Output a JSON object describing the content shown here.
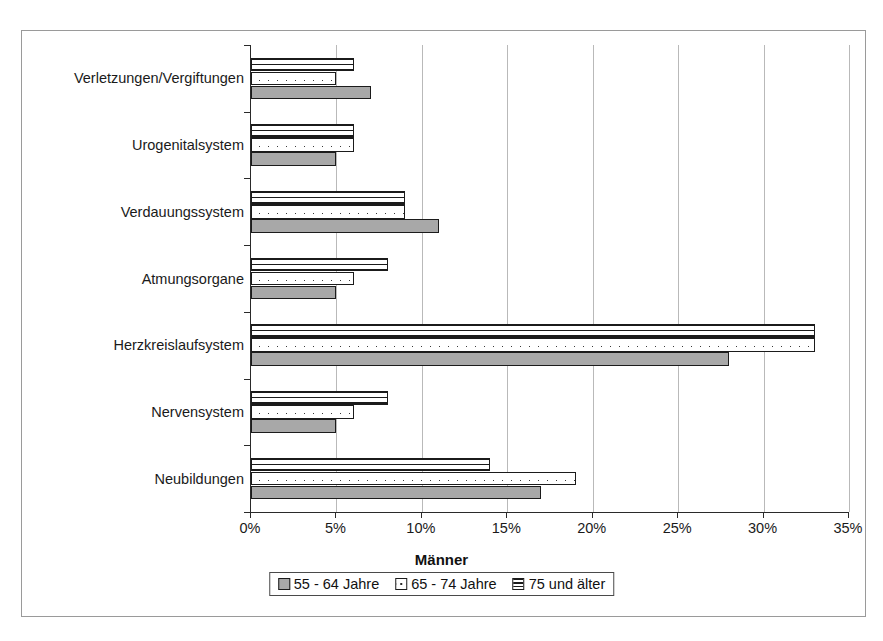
{
  "chart_data": {
    "type": "bar",
    "orientation": "horizontal",
    "title": "Männer",
    "xlabel": "",
    "ylabel": "",
    "xlim": [
      0,
      35
    ],
    "xticks": [
      0,
      5,
      10,
      15,
      20,
      25,
      30,
      35
    ],
    "xtick_labels": [
      "0%",
      "5%",
      "10%",
      "15%",
      "20%",
      "25%",
      "30%",
      "35%"
    ],
    "grid": "vertical",
    "legend_position": "bottom",
    "legend_title": "Männer",
    "categories": [
      "Neubildungen",
      "Nervensystem",
      "Herzkreislaufsystem",
      "Atmungsorgane",
      "Verdauungssystem",
      "Urogenitalsystem",
      "Verletzungen/Vergiftungen"
    ],
    "series": [
      {
        "name": "55 - 64 Jahre",
        "pattern": "solid-gray",
        "color": "#a8a8a8",
        "values": [
          17,
          5,
          28,
          5,
          11,
          5,
          7
        ]
      },
      {
        "name": "65 - 74 Jahre",
        "pattern": "dotted",
        "color": "#ffffff",
        "values": [
          19,
          6,
          33,
          6,
          9,
          6,
          5
        ]
      },
      {
        "name": "75 und älter",
        "pattern": "horizontal-lines",
        "color": "#ffffff",
        "values": [
          14,
          8,
          33,
          8,
          9,
          6,
          6
        ]
      }
    ]
  },
  "colors": {
    "frame": "#9a9a9a",
    "axis": "#2a2a2a",
    "grid": "#b9b9b9",
    "bar_outline": "#1b1b1b",
    "series_55_64": "#a8a8a8"
  }
}
